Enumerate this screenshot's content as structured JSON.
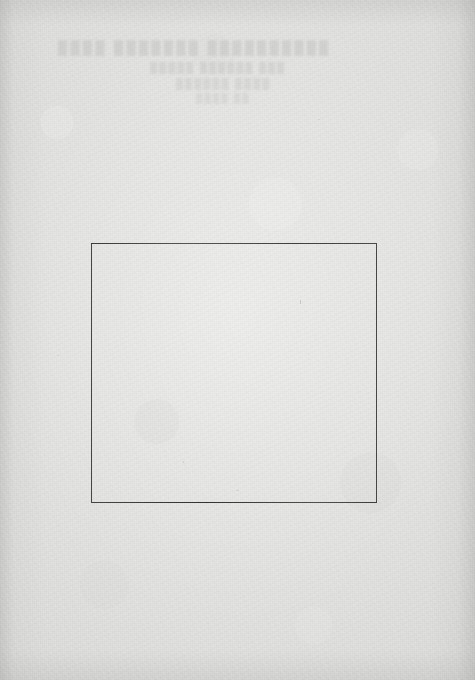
{
  "page": {
    "kind": "scanned-book-page",
    "width": 475,
    "height": 680,
    "paper_color": "#dcdcda",
    "ink_color": "#464646"
  },
  "bleed_through": {
    "note": "Illegible ghosted text bleeding through from the verso; rendered as blurred smudges, no readable characters.",
    "color": "#bcbcba",
    "line_1": "████  ███████   ██████████",
    "line_2": "█████  ██████  ███",
    "line_3": "██████  ████",
    "line_4": "████  ██"
  },
  "figure_frame": {
    "label": "",
    "caption": "",
    "content": "",
    "is_empty": true,
    "border_color": "#464646",
    "border_width_px": 1,
    "left_px": 91,
    "top_px": 243,
    "width_px": 286,
    "height_px": 260
  }
}
